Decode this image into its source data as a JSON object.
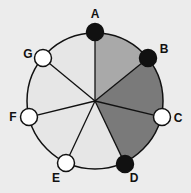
{
  "diagram": {
    "type": "ring-of-nodes",
    "center": {
      "x": 95,
      "y": 101
    },
    "radius": 68,
    "node_radius": 8.5,
    "background": "#ececec",
    "outline_color": "#111111",
    "nodes": [
      {
        "id": "A",
        "label": "A",
        "x": 95,
        "y": 32,
        "fill": "#111111",
        "label_x": 95,
        "label_y": 18
      },
      {
        "id": "B",
        "label": "B",
        "x": 148,
        "y": 58,
        "fill": "#111111",
        "label_x": 164,
        "label_y": 53
      },
      {
        "id": "C",
        "label": "C",
        "x": 162,
        "y": 117,
        "fill": "#ffffff",
        "label_x": 178,
        "label_y": 122
      },
      {
        "id": "D",
        "label": "D",
        "x": 125,
        "y": 164,
        "fill": "#111111",
        "label_x": 134,
        "label_y": 182
      },
      {
        "id": "E",
        "label": "E",
        "x": 66,
        "y": 163,
        "fill": "#ffffff",
        "label_x": 56,
        "label_y": 182
      },
      {
        "id": "F",
        "label": "F",
        "x": 29,
        "y": 117,
        "fill": "#ffffff",
        "label_x": 13,
        "label_y": 121
      },
      {
        "id": "G",
        "label": "G",
        "x": 43,
        "y": 58,
        "fill": "#ffffff",
        "label_x": 28,
        "label_y": 58
      }
    ],
    "sectors": [
      {
        "from": "A",
        "to": "B",
        "fill": "#a9a9a9"
      },
      {
        "from": "B",
        "to": "C",
        "fill": "#7a7a7a"
      },
      {
        "from": "C",
        "to": "D",
        "fill": "#7a7a7a"
      },
      {
        "from": "D",
        "to": "E",
        "fill": "#e6e6e6"
      },
      {
        "from": "E",
        "to": "F",
        "fill": "#e6e6e6"
      },
      {
        "from": "F",
        "to": "G",
        "fill": "#e6e6e6"
      },
      {
        "from": "G",
        "to": "A",
        "fill": "#e6e6e6"
      }
    ]
  }
}
